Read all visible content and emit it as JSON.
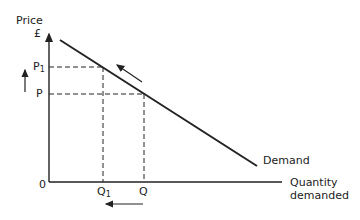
{
  "diagram": {
    "y_axis": {
      "label_line1": "Price",
      "label_line2": "£"
    },
    "x_axis": {
      "label_line1": "Quantity",
      "label_line2": "demanded"
    },
    "origin_label": "0",
    "curve_label": "Demand",
    "price_levels": [
      {
        "main": "P",
        "sub": "1"
      },
      {
        "main": "P",
        "sub": ""
      }
    ],
    "quantity_levels": [
      {
        "main": "Q",
        "sub": "1"
      },
      {
        "main": "Q",
        "sub": ""
      }
    ],
    "annotations": {
      "price_arrow": "up",
      "quantity_arrow": "left",
      "curve_arrow": "up-left"
    }
  }
}
